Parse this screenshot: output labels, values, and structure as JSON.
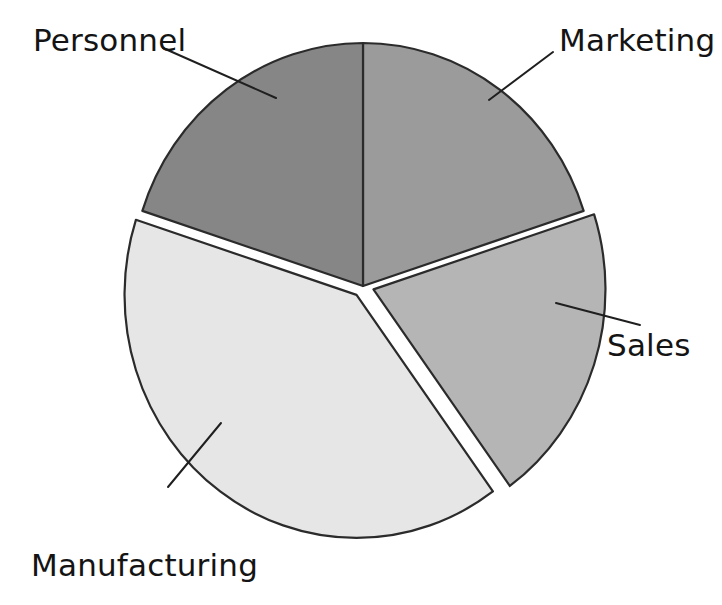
{
  "chart_data": {
    "type": "pie",
    "title": "",
    "subtitle": "",
    "xlabel": "",
    "ylabel": "",
    "legend_position": "none",
    "grid": false,
    "labels_on_chart": true,
    "categories": [
      "Marketing",
      "Sales",
      "Manufacturing",
      "Personnel"
    ],
    "values": [
      20,
      20,
      40,
      20
    ],
    "slices": [
      {
        "label": "Marketing",
        "value": 20,
        "percent": 20,
        "color": "#9b9b9b",
        "start_angle_deg": 0,
        "end_angle_deg": 72,
        "exploded": false,
        "label_position": "top-right",
        "label_x": 559,
        "label_y": 25,
        "leader_from": [
          489,
          100
        ],
        "leader_to": [
          553,
          52
        ]
      },
      {
        "label": "Sales",
        "value": 20,
        "percent": 20,
        "color": "#b5b5b5",
        "start_angle_deg": 72,
        "end_angle_deg": 144,
        "exploded": true,
        "label_position": "right",
        "label_x": 607,
        "label_y": 330,
        "leader_from": [
          556,
          303
        ],
        "leader_to": [
          640,
          325
        ]
      },
      {
        "label": "Manufacturing",
        "value": 40,
        "percent": 40,
        "color": "#e6e6e6",
        "start_angle_deg": 144,
        "end_angle_deg": 288,
        "exploded": true,
        "label_position": "bottom-left",
        "label_x": 31,
        "label_y": 550,
        "leader_from": [
          221,
          423
        ],
        "leader_to": [
          168,
          487
        ]
      },
      {
        "label": "Personnel",
        "value": 20,
        "percent": 20,
        "color": "#868686",
        "start_angle_deg": 288,
        "end_angle_deg": 360,
        "exploded": false,
        "label_position": "top-left",
        "label_x": 33,
        "label_y": 25,
        "leader_from": [
          276,
          98
        ],
        "leader_to": [
          163,
          48
        ]
      }
    ],
    "geometry": {
      "center_x": 363,
      "center_y": 286,
      "radius_x": 232,
      "radius_y": 243,
      "start_at_12_oclock": true,
      "direction": "clockwise"
    },
    "colors": {
      "personnel": "#868686",
      "marketing": "#9b9b9b",
      "sales": "#b5b5b5",
      "manufacturing": "#e6e6e6",
      "outline": "#2b2b2b",
      "background": "#ffffff",
      "text": "#141414"
    }
  },
  "labels": {
    "personnel": "Personnel",
    "marketing": "Marketing",
    "sales": "Sales",
    "manufacturing": "Manufacturing"
  }
}
